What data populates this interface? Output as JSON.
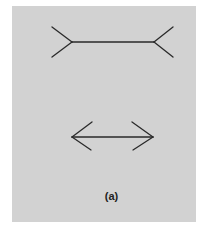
{
  "figure": {
    "caption": "(a)",
    "panel_color": "#d2d2d2",
    "line_color": "#2a2a2a",
    "top_figure": {
      "type": "fins-out",
      "shaft": [
        72,
        42,
        154,
        42
      ],
      "fins": [
        [
          52,
          27,
          72,
          42
        ],
        [
          52,
          57,
          72,
          42
        ],
        [
          154,
          42,
          173,
          27
        ],
        [
          154,
          42,
          173,
          57
        ]
      ]
    },
    "bottom_figure": {
      "type": "arrows-in",
      "shaft": [
        72,
        137,
        153,
        137
      ],
      "fins": [
        [
          72,
          137,
          92,
          122
        ],
        [
          72,
          137,
          91,
          150
        ],
        [
          153,
          137,
          132,
          122
        ],
        [
          153,
          137,
          133,
          150
        ]
      ]
    }
  }
}
